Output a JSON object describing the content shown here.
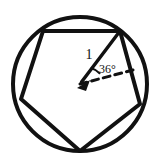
{
  "figure": {
    "background_color": "#ffffff",
    "stroke_color": "#111111",
    "labels": {
      "radius_label": "1",
      "angle_label": "36°"
    },
    "circle": {
      "center_x": 80,
      "center_y": 84,
      "radius": 67,
      "stroke_width": 4
    },
    "pentagon": {
      "vertex_count": 5,
      "stroke_width": 4,
      "vertices": [
        {
          "name": "top-left-vertex",
          "x": 43,
          "y": 31
        },
        {
          "name": "top-right-vertex",
          "x": 120,
          "y": 31
        },
        {
          "name": "right-vertex",
          "x": 140,
          "y": 104
        },
        {
          "name": "bottom-vertex",
          "x": 80,
          "y": 151
        },
        {
          "name": "left-vertex",
          "x": 21,
          "y": 99
        }
      ]
    },
    "radius_segment": {
      "from_x": 80,
      "from_y": 84,
      "to_x": 120,
      "to_y": 31,
      "stroke_width": 3.4,
      "arrow": true
    },
    "dashed_ray": {
      "from_x": 80,
      "from_y": 84,
      "to_x": 133,
      "to_y": 70,
      "stroke_width": 3,
      "dash_pattern": "7 5"
    },
    "angle_arc": {
      "center_x": 80,
      "center_y": 84,
      "radius": 20,
      "stroke_width": 2
    },
    "radius_label_position": {
      "x": 89,
      "y": 59
    },
    "angle_label_position": {
      "x": 99,
      "y": 72
    }
  }
}
